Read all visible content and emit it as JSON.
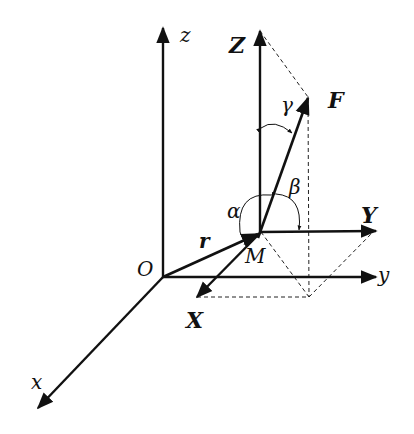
{
  "diagram": {
    "colors": {
      "ink": "#111111",
      "background": "#ffffff"
    },
    "labels": {
      "z_axis": "z",
      "y_axis": "y",
      "x_axis": "x",
      "origin": "O",
      "point": "M",
      "position_vector": "r",
      "force": "F",
      "Z_component": "Z",
      "Y_component": "Y",
      "X_component": "X",
      "alpha": "α",
      "beta": "β",
      "gamma": "γ"
    },
    "nodes": [
      {
        "id": "O",
        "label": "O",
        "x": 163,
        "y": 277
      },
      {
        "id": "M",
        "label": "M",
        "x": 261,
        "y": 232
      },
      {
        "id": "F_tip",
        "label": "F",
        "x": 308,
        "y": 98
      },
      {
        "id": "Z_tip",
        "label": "Z",
        "x": 260,
        "y": 30
      },
      {
        "id": "Y_tip",
        "label": "Y",
        "x": 375,
        "y": 231
      },
      {
        "id": "X_tip",
        "label": "X",
        "x": 197,
        "y": 296
      },
      {
        "id": "proj",
        "label": "",
        "x": 309,
        "y": 297
      }
    ],
    "edges": [
      {
        "from": "O",
        "to": "z",
        "label": "z",
        "style": "solid-arrow"
      },
      {
        "from": "O",
        "to": "y",
        "label": "y",
        "style": "solid-arrow"
      },
      {
        "from": "O",
        "to": "x",
        "label": "x",
        "style": "solid-arrow"
      },
      {
        "from": "O",
        "to": "M",
        "label": "r",
        "style": "solid-arrow"
      },
      {
        "from": "M",
        "to": "F_tip",
        "label": "F",
        "style": "solid-arrow"
      },
      {
        "from": "M",
        "to": "Z_tip",
        "label": "Z",
        "style": "solid-arrow"
      },
      {
        "from": "M",
        "to": "Y_tip",
        "label": "Y",
        "style": "solid-arrow"
      },
      {
        "from": "M",
        "to": "X_tip",
        "label": "X",
        "style": "solid-arrow"
      },
      {
        "from": "Z_tip",
        "to": "F_tip",
        "style": "dashed"
      },
      {
        "from": "F_tip",
        "to": "proj",
        "style": "dashed"
      },
      {
        "from": "X_tip",
        "to": "proj",
        "style": "dashed"
      },
      {
        "from": "M",
        "to": "proj",
        "style": "dashed"
      },
      {
        "from": "proj",
        "to": "Y_tip",
        "style": "dashed"
      }
    ],
    "angles": [
      {
        "label": "α",
        "between": [
          "F",
          "X"
        ]
      },
      {
        "label": "β",
        "between": [
          "F",
          "Y"
        ]
      },
      {
        "label": "γ",
        "between": [
          "F",
          "Z"
        ]
      }
    ]
  }
}
